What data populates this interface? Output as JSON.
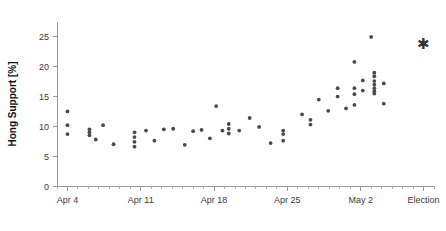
{
  "chart_data": {
    "type": "scatter",
    "title": "",
    "xlabel": "",
    "ylabel": "Hong Support [%]",
    "ylim": [
      0,
      27.5
    ],
    "xlim": [
      0,
      36
    ],
    "grid": false,
    "legend": null,
    "y_ticks": [
      0,
      5,
      10,
      15,
      20,
      25
    ],
    "y_tick_labels": [
      "0",
      "5",
      "10",
      "15",
      "20",
      "25"
    ],
    "x_ticks": [
      1,
      8,
      15,
      22,
      29,
      35
    ],
    "x_tick_labels": [
      "Apr 4",
      "Apr 11",
      "Apr 18",
      "Apr 25",
      "May 2",
      "Election"
    ],
    "x_minor_tick_step": 1,
    "point_color": "#4a4a4a",
    "axis_color": "#9a9a9a",
    "series": [
      {
        "name": "polls",
        "marker": "circle",
        "points": [
          {
            "x": 1.0,
            "y": 12.5
          },
          {
            "x": 1.0,
            "y": 10.2
          },
          {
            "x": 1.0,
            "y": 8.7
          },
          {
            "x": 3.1,
            "y": 9.5
          },
          {
            "x": 3.1,
            "y": 9.0
          },
          {
            "x": 3.1,
            "y": 8.5
          },
          {
            "x": 3.7,
            "y": 7.8
          },
          {
            "x": 4.4,
            "y": 10.2
          },
          {
            "x": 5.4,
            "y": 7.0
          },
          {
            "x": 7.4,
            "y": 9.0
          },
          {
            "x": 7.4,
            "y": 8.2
          },
          {
            "x": 7.4,
            "y": 7.4
          },
          {
            "x": 7.4,
            "y": 6.6
          },
          {
            "x": 8.5,
            "y": 9.3
          },
          {
            "x": 9.3,
            "y": 7.6
          },
          {
            "x": 10.2,
            "y": 9.5
          },
          {
            "x": 11.1,
            "y": 9.6
          },
          {
            "x": 12.2,
            "y": 6.9
          },
          {
            "x": 13.0,
            "y": 9.2
          },
          {
            "x": 13.8,
            "y": 9.4
          },
          {
            "x": 14.6,
            "y": 8.0
          },
          {
            "x": 15.2,
            "y": 13.4
          },
          {
            "x": 15.8,
            "y": 9.3
          },
          {
            "x": 16.4,
            "y": 10.4
          },
          {
            "x": 16.4,
            "y": 9.6
          },
          {
            "x": 16.4,
            "y": 8.8
          },
          {
            "x": 17.4,
            "y": 9.3
          },
          {
            "x": 18.4,
            "y": 11.4
          },
          {
            "x": 19.3,
            "y": 9.9
          },
          {
            "x": 20.4,
            "y": 7.2
          },
          {
            "x": 21.6,
            "y": 9.3
          },
          {
            "x": 21.6,
            "y": 8.7
          },
          {
            "x": 21.6,
            "y": 7.6
          },
          {
            "x": 23.4,
            "y": 12.0
          },
          {
            "x": 24.2,
            "y": 11.1
          },
          {
            "x": 24.2,
            "y": 10.3
          },
          {
            "x": 25.0,
            "y": 14.5
          },
          {
            "x": 25.9,
            "y": 12.6
          },
          {
            "x": 26.8,
            "y": 16.4
          },
          {
            "x": 26.8,
            "y": 15.0
          },
          {
            "x": 27.6,
            "y": 13.0
          },
          {
            "x": 28.4,
            "y": 20.8
          },
          {
            "x": 28.4,
            "y": 16.4
          },
          {
            "x": 28.4,
            "y": 15.4
          },
          {
            "x": 28.4,
            "y": 13.6
          },
          {
            "x": 29.2,
            "y": 17.7
          },
          {
            "x": 29.2,
            "y": 16.0
          },
          {
            "x": 30.0,
            "y": 25.0
          },
          {
            "x": 30.3,
            "y": 19.0
          },
          {
            "x": 30.3,
            "y": 18.4
          },
          {
            "x": 30.3,
            "y": 17.6
          },
          {
            "x": 30.3,
            "y": 17.0
          },
          {
            "x": 30.3,
            "y": 16.4
          },
          {
            "x": 30.3,
            "y": 15.9
          },
          {
            "x": 30.3,
            "y": 15.5
          },
          {
            "x": 31.2,
            "y": 17.2
          },
          {
            "x": 31.2,
            "y": 13.8
          }
        ]
      },
      {
        "name": "election-result",
        "marker": "star",
        "points": [
          {
            "x": 35.0,
            "y": 24.0
          }
        ]
      }
    ]
  },
  "axes": {
    "plot_left": 57,
    "plot_right": 434,
    "plot_top": 22,
    "plot_bottom": 186
  }
}
